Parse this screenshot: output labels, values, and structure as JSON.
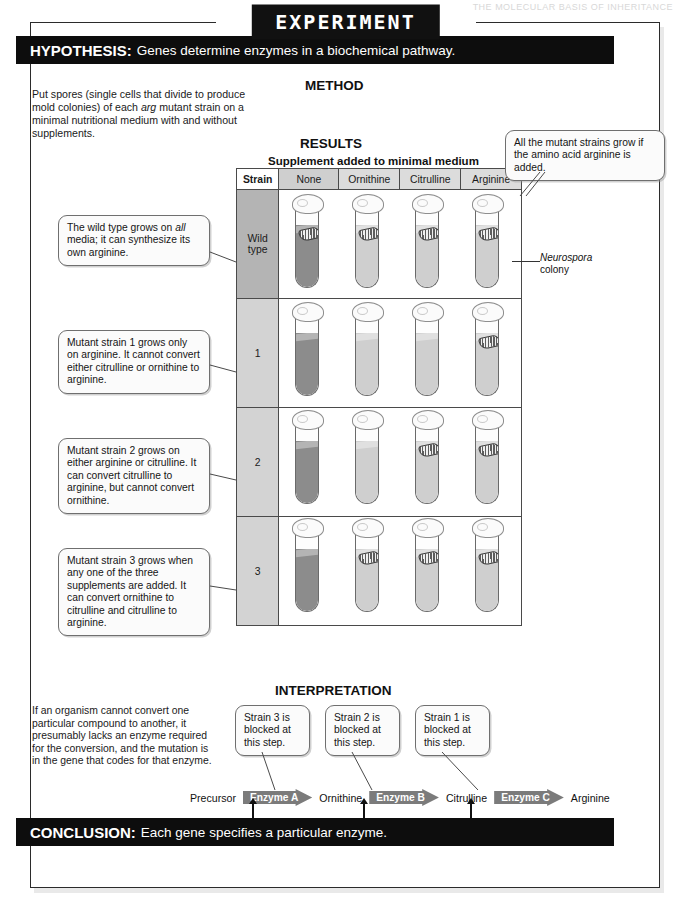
{
  "page_header": "THE MOLECULAR BASIS OF INHERITANCE",
  "experiment_tab": "EXPERIMENT",
  "hypothesis": {
    "label": "HYPOTHESIS:",
    "text": "Genes determine enzymes in a biochemical pathway."
  },
  "conclusion": {
    "label": "CONCLUSION:",
    "text": "Each gene specifies a particular enzyme."
  },
  "method": {
    "heading": "METHOD",
    "text_parts": [
      "Put spores (single cells that divide to produce mold colonies) of each ",
      "arg",
      " mutant strain on a minimal nutritional medium with and without supplements."
    ]
  },
  "results": {
    "heading": "RESULTS",
    "supplement_label": "Supplement added to minimal medium",
    "columns": [
      "Strain",
      "None",
      "Ornithine",
      "Citrulline",
      "Arginine"
    ],
    "neurospora_label_italic": "Neurospora",
    "neurospora_label_rest": "colony",
    "rows": [
      {
        "strain": "Wild type",
        "growth": [
          true,
          true,
          true,
          true
        ]
      },
      {
        "strain": "1",
        "growth": [
          false,
          false,
          false,
          true
        ]
      },
      {
        "strain": "2",
        "growth": [
          false,
          false,
          true,
          true
        ]
      },
      {
        "strain": "3",
        "growth": [
          false,
          true,
          true,
          true
        ]
      }
    ]
  },
  "callouts": {
    "wild": {
      "a": "The wild type grows on ",
      "b": "all",
      "c": " media; it can synthesize its own arginine."
    },
    "strain1": "Mutant strain 1 grows only on arginine. It cannot convert either citrulline or ornithine to arginine.",
    "strain2": "Mutant strain 2 grows on either arginine or citrulline. It can convert citrulline to arginine, but cannot convert ornithine.",
    "strain3": "Mutant strain 3 grows when any one of the three supplements are added. It can convert ornithine to citrulline and citrulline to arginine.",
    "arginine_note": "All the mutant strains grow if the amino acid arginine is added."
  },
  "interpretation": {
    "heading": "INTERPRETATION",
    "text": "If an organism cannot convert one particular compound to another, it presumably lacks an enzyme required for the conversion, and the mutation is in the gene that codes for that enzyme.",
    "blocked_notes": [
      "Strain 3 is blocked at this step.",
      "Strain 2 is blocked at this step.",
      "Strain 1 is blocked at this step."
    ],
    "pathway": {
      "terms": [
        "Precursor",
        "Ornithine",
        "Citrulline",
        "Arginine"
      ],
      "enzymes": [
        "Enzyme A",
        "Enzyme B",
        "Enzyme C"
      ],
      "genes": [
        "Gene A",
        "Gene B",
        "Gene C"
      ]
    }
  },
  "colors": {
    "bar": "#0d0d0d",
    "medium_dark": "#8c8c8c",
    "medium_light": "#cfcfcf",
    "enzyme": "#7b7b7b"
  }
}
